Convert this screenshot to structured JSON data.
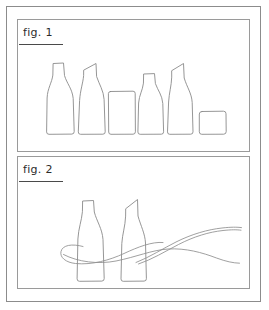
{
  "sheet": {
    "background_color": "#ffffff",
    "frame_color": "#8c8c8c",
    "line_color": "#8a8a8a",
    "text_color": "#2b2b2b"
  },
  "panels": [
    {
      "id": "panel-1",
      "label": "fig. 1",
      "subject": "row of six bottle and tumbler profile outlines",
      "object_count": 6,
      "objects": [
        {
          "name": "tall-round-shoulder-bottle",
          "shape": "bottle",
          "neck": "flat-top-narrow-neck",
          "body": "curved-shoulder-tapered"
        },
        {
          "name": "angled-top-bottle",
          "shape": "bottle",
          "neck": "slanted-cut-top",
          "body": "straight-tapered-shoulder"
        },
        {
          "name": "rectangular-tumbler",
          "shape": "tumbler",
          "neck": "none",
          "body": "straight-rectangular"
        },
        {
          "name": "classic-neck-bottle",
          "shape": "bottle",
          "neck": "flat-top-short-neck",
          "body": "curved-shoulder"
        },
        {
          "name": "angled-top-slim-bottle",
          "shape": "bottle",
          "neck": "slanted-cut-top",
          "body": "long-tapered"
        },
        {
          "name": "short-wide-tumbler",
          "shape": "tumbler",
          "neck": "none",
          "body": "short-rounded-square"
        }
      ]
    },
    {
      "id": "panel-2",
      "label": "fig. 2",
      "subject": "two bottles wrapped by crossing ribbon curves",
      "object_count": 2,
      "objects": [
        {
          "name": "round-shoulder-bottle",
          "shape": "bottle",
          "neck": "flat-top-narrow-neck",
          "body": "curved-shoulder-tapered"
        },
        {
          "name": "angled-top-bottle",
          "shape": "bottle",
          "neck": "slanted-cut-top",
          "body": "straight-tapered"
        }
      ],
      "decorations": [
        {
          "name": "ribbon-loop-left",
          "shape": "looping-curve-around-left-bottle"
        },
        {
          "name": "ribbon-sweep-upper-right",
          "shape": "rising-curve-to-right-edge"
        },
        {
          "name": "ribbon-sweep-lower-right",
          "shape": "falling-curve-to-right-edge"
        }
      ]
    }
  ]
}
